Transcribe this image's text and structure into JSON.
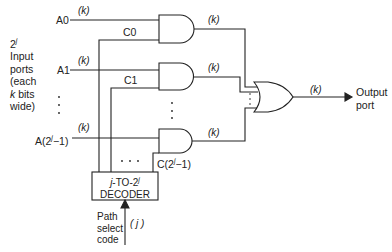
{
  "diagram": {
    "side_label": {
      "line1": "2",
      "line1_sup": "j",
      "line2": "Input",
      "line3": "ports",
      "line4": "(each",
      "line5_k": "k",
      "line5": " bits",
      "line6": "wide)"
    },
    "inputs": [
      {
        "name": "A0",
        "width": "(k)",
        "control": "C0"
      },
      {
        "name": "A1",
        "width": "(k)",
        "control": "C1"
      },
      {
        "name": "A(2j−1)",
        "name_base": "A(2",
        "name_sup": "j",
        "name_tail": "−1)",
        "width": "(k)",
        "control_base": "C(2",
        "control_sup": "j",
        "control_tail": "−1)"
      }
    ],
    "and_outputs": [
      "(k)",
      "(k)",
      "(k)"
    ],
    "or_output_width": "(k)",
    "output_label": {
      "line1": "Output",
      "line2": "port"
    },
    "decoder": {
      "line1_a": "j",
      "line1_b": "-TO-2",
      "line1_sup": "j",
      "line2": "DECODER"
    },
    "select": {
      "line1": "Path",
      "line2": "select",
      "line3": "code",
      "width": "( j )"
    },
    "ellipsis_vertical": "⋮",
    "ellipsis_horizontal": ". . ."
  }
}
